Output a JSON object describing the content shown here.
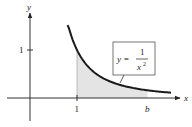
{
  "chart_data": {
    "type": "area",
    "title": "",
    "function": "y = 1/x^2",
    "xlabel": "x",
    "ylabel": "y",
    "x_ticks": [
      {
        "value": 1,
        "label": "1"
      },
      {
        "value": 2.5,
        "label": "b"
      }
    ],
    "y_ticks": [
      {
        "value": 1,
        "label": "1"
      }
    ],
    "shaded_region": {
      "from": 1,
      "to": "b",
      "under": "y = 1/x^2"
    },
    "curve_domain": [
      0.8,
      3.0
    ],
    "grid": false
  },
  "labels": {
    "y_axis": "y",
    "x_axis": "x",
    "x_tick_1": "1",
    "y_tick_1": "1",
    "b": "b",
    "eq_lhs": "y =",
    "eq_num": "1",
    "eq_den": "x",
    "eq_exp": "2"
  },
  "colors": {
    "curve": "#1a1a1a",
    "axis": "#333333",
    "shade": "#e4e4e4"
  }
}
